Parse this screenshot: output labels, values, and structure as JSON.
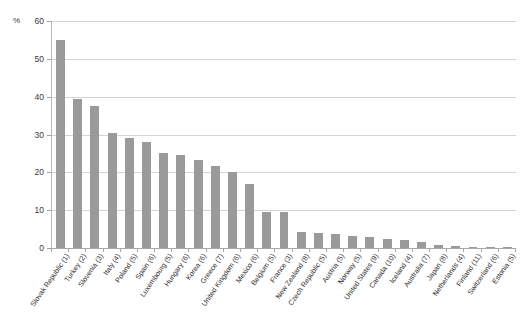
{
  "chart_data": {
    "type": "bar",
    "title": "",
    "subtitle": "",
    "xlabel": "",
    "ylabel": "",
    "unit_label": "%",
    "ylim": [
      0,
      60
    ],
    "ytick_step": 10,
    "yticks": [
      0,
      10,
      20,
      30,
      40,
      50,
      60
    ],
    "grid": true,
    "legend": "none",
    "bar_color": "#9a9a9a",
    "gridline_color": "#d4d4d4",
    "axis_color": "#a8a8a8",
    "categories": [
      "Slovak Republic (1)",
      "Turkey (2)",
      "Slovenia (3)",
      "Italy (4)",
      "Poland (5)",
      "Spain (6)",
      "Luxembourg (5)",
      "Hungary (6)",
      "Korea (6)",
      "Greece (7)",
      "United Kingdom (6)",
      "Mexico (6)",
      "Belgium (5)",
      "France (3)",
      "New Zealand (8)",
      "Czech Republic (5)",
      "Austria (5)",
      "Norway (5)",
      "United States (9)",
      "Canada (10)",
      "Iceland (4)",
      "Australia (7)",
      "Japan (8)",
      "Netherlands (4)",
      "Finland (11)",
      "Switzerland (6)",
      "Estonia (5)"
    ],
    "values": [
      55.0,
      39.5,
      37.5,
      30.5,
      29.2,
      28.0,
      25.2,
      24.7,
      23.3,
      21.8,
      20.0,
      17.0,
      9.5,
      9.4,
      4.2,
      4.0,
      3.6,
      3.3,
      2.8,
      2.5,
      2.2,
      1.6,
      0.8,
      0.5,
      0.4,
      0.2,
      0.1
    ]
  }
}
